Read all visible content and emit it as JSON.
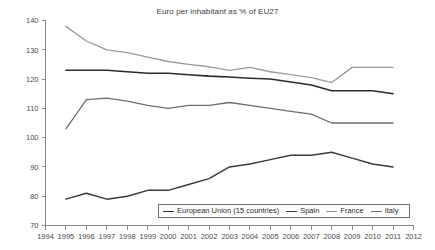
{
  "chart_data": {
    "type": "line",
    "title": "Euro per inhabitant as % of EU27",
    "xlabel": "",
    "ylabel": "",
    "xlim": [
      1994,
      2012
    ],
    "ylim": [
      70,
      140
    ],
    "ytick_step": 10,
    "grid": false,
    "legend_position": "bottom-right-inside",
    "x": [
      1995,
      1996,
      1997,
      1998,
      1999,
      2000,
      2001,
      2002,
      2003,
      2004,
      2005,
      2006,
      2007,
      2008,
      2009,
      2010,
      2011
    ],
    "xtick_labels": [
      "1994",
      "1995",
      "1996",
      "1997",
      "1998",
      "1999",
      "2000",
      "2001",
      "2002",
      "2003",
      "2004",
      "2005",
      "2006",
      "2007",
      "2008",
      "2009",
      "2010",
      "2011",
      "2012"
    ],
    "ytick_labels": [
      "70",
      "80",
      "90",
      "100",
      "110",
      "120",
      "130",
      "140"
    ],
    "series": [
      {
        "name": "European Union (15 countries)",
        "color": "#2b2b2b",
        "width": 1.6,
        "values": [
          123,
          123,
          123,
          122.5,
          122,
          122,
          121.5,
          121,
          120.7,
          120.3,
          120,
          119,
          118,
          116,
          116,
          116,
          115
        ]
      },
      {
        "name": "Spain",
        "color": "#3a3a3a",
        "width": 1.5,
        "values": [
          79,
          81,
          79,
          80,
          82,
          82,
          84,
          86,
          90,
          91,
          92.5,
          94,
          94,
          95,
          93,
          91,
          90
        ]
      },
      {
        "name": "France",
        "color": "#9a9a9a",
        "width": 1.3,
        "values": [
          138,
          133,
          130,
          129,
          127.5,
          126,
          125,
          124.2,
          123,
          124,
          122.5,
          121.5,
          120.5,
          118.8,
          124,
          124,
          124
        ]
      },
      {
        "name": "Italy",
        "color": "#6e6e6e",
        "width": 1.3,
        "values": [
          103,
          113,
          113.5,
          112.5,
          111,
          110,
          111,
          111,
          112,
          111,
          110,
          109,
          108,
          105,
          105,
          105,
          105
        ]
      }
    ]
  }
}
